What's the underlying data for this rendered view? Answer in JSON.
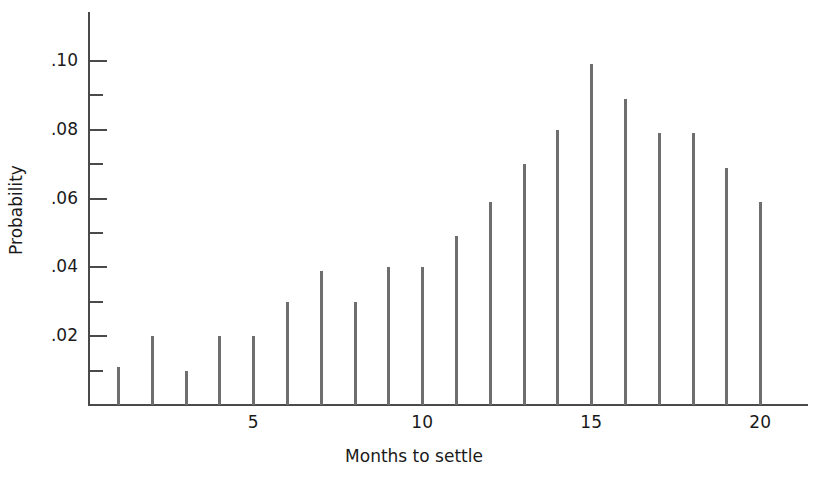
{
  "chart_data": {
    "type": "bar",
    "title": "",
    "xlabel": "Months to settle",
    "ylabel": "Probability",
    "categories": [
      1,
      2,
      3,
      4,
      5,
      6,
      7,
      8,
      9,
      10,
      11,
      12,
      13,
      14,
      15,
      16,
      17,
      18,
      19,
      20
    ],
    "values": [
      0.011,
      0.02,
      0.01,
      0.02,
      0.02,
      0.03,
      0.039,
      0.03,
      0.04,
      0.04,
      0.049,
      0.059,
      0.07,
      0.08,
      0.099,
      0.089,
      0.079,
      0.079,
      0.069,
      0.059
    ],
    "xlim": [
      0,
      21.2
    ],
    "ylim": [
      0,
      0.1143
    ],
    "grid": false,
    "legend": null,
    "y_major_ticks": [
      0.02,
      0.04,
      0.06,
      0.08,
      0.1
    ],
    "y_major_tick_labels": [
      ".02",
      ".04",
      ".06",
      ".08",
      ".10"
    ],
    "y_minor_ticks": [
      0.01,
      0.03,
      0.05,
      0.07,
      0.09
    ],
    "x_ticks": [
      1,
      2,
      3,
      4,
      5,
      6,
      7,
      8,
      9,
      10,
      11,
      12,
      13,
      14,
      15,
      16,
      17,
      18,
      19,
      20
    ],
    "x_tick_labels": {
      "5": "5",
      "10": "10",
      "15": "15",
      "20": "20"
    },
    "bar_color": "#6e6e6e",
    "axis_color": "#4a4a4a",
    "text_color": "#1a1a1a",
    "background_color": "#ffffff"
  },
  "geometry": {
    "baseline_y": 405,
    "y_value_at_top_tick": 0.1,
    "y_pixel_at_top_tick": 61,
    "x_first_bar": 118,
    "x_bar_spacing": 33.8,
    "y_axis_top": 12,
    "x_axis_right": 808
  }
}
